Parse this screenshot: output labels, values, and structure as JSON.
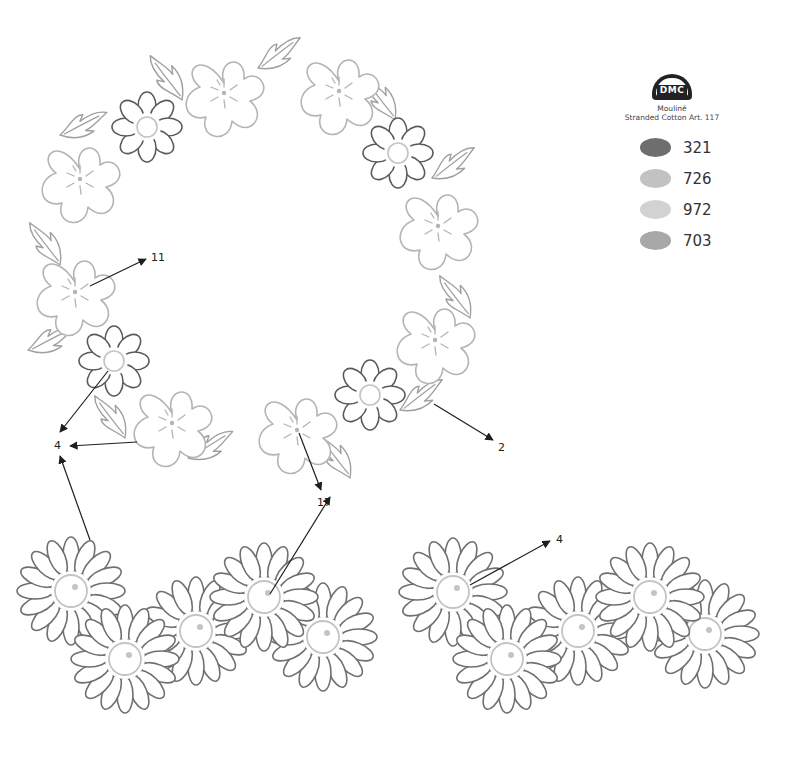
{
  "legend": {
    "brand": "DMC",
    "product_line1": "Mouliné",
    "product_line2": "Stranded Cotton Art. 117",
    "threads": [
      {
        "code": "321",
        "color": "#6e6e6e"
      },
      {
        "code": "726",
        "color": "#c2c2c2"
      },
      {
        "code": "972",
        "color": "#d2d2d2"
      },
      {
        "code": "703",
        "color": "#a8a8a8"
      }
    ]
  },
  "callouts": [
    {
      "label": "11",
      "x": 151,
      "y": 251
    },
    {
      "label": "4",
      "x": 54,
      "y": 439
    },
    {
      "label": "2",
      "x": 498,
      "y": 441
    },
    {
      "label": "17",
      "x": 317,
      "y": 496
    },
    {
      "label": "4",
      "x": 556,
      "y": 533
    }
  ],
  "colors": {
    "dark_outline": "#5a5a5a",
    "light_outline": "#b4b4b4",
    "leaf_outline": "#a0a0a0",
    "daisy_outline": "#707070",
    "center_outline": "#c4c4c4",
    "arrow": "#1e1e1e"
  }
}
